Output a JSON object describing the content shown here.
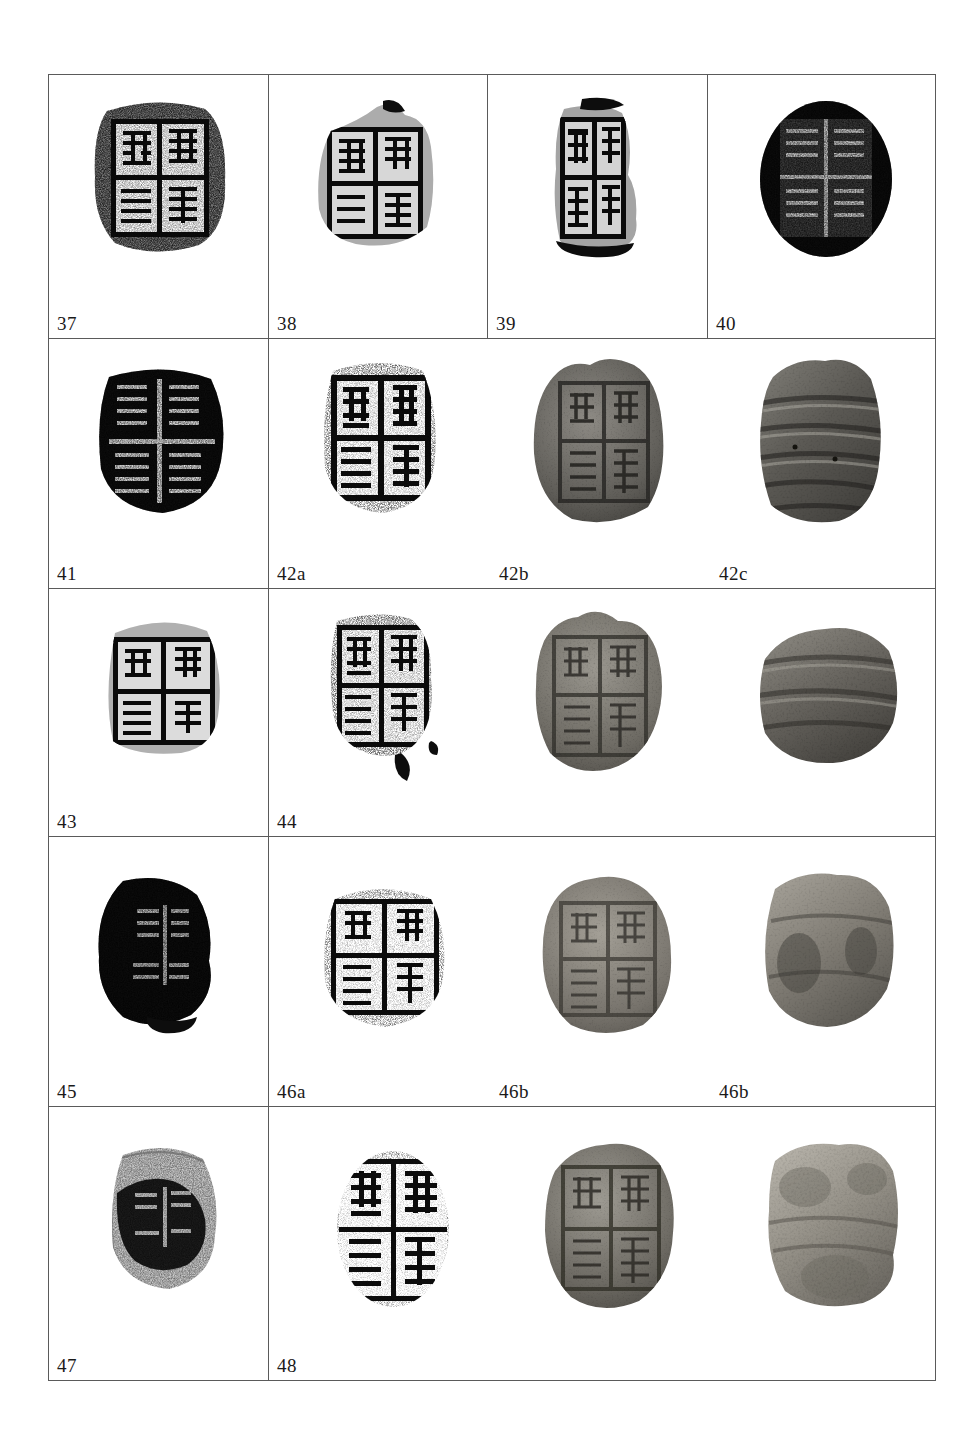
{
  "page": {
    "running_head": "",
    "plate_kind": "archaeological-plate",
    "figure_medium_legend": {
      "rubbing": "ink rubbing of seal impression",
      "photograph": "photograph of clay sealing"
    },
    "background_color": "#ffffff",
    "border_color": "#5a5a5a",
    "ink_color": "#0d0d0d"
  },
  "table": {
    "rows": [
      {
        "row_index": 1,
        "cells": [
          {
            "label": "37",
            "medium": "rubbing",
            "subject": "clay-sealing-impression",
            "colspan": 1,
            "figures": [
              {
                "name": "figure-37",
                "medium": "rubbing"
              }
            ]
          },
          {
            "label": "38",
            "medium": "rubbing",
            "subject": "clay-sealing-impression",
            "colspan": 1,
            "figures": [
              {
                "name": "figure-38",
                "medium": "rubbing"
              }
            ]
          },
          {
            "label": "39",
            "medium": "rubbing",
            "subject": "clay-sealing-impression",
            "colspan": 1,
            "figures": [
              {
                "name": "figure-39",
                "medium": "rubbing"
              }
            ]
          },
          {
            "label": "40",
            "medium": "rubbing",
            "subject": "clay-sealing-impression",
            "colspan": 1,
            "figures": [
              {
                "name": "figure-40",
                "medium": "rubbing"
              }
            ]
          }
        ]
      },
      {
        "row_index": 2,
        "cells": [
          {
            "label": "41",
            "medium": "rubbing",
            "subject": "clay-sealing-impression",
            "colspan": 1,
            "figures": [
              {
                "name": "figure-41",
                "medium": "rubbing"
              }
            ]
          },
          {
            "label": "42a",
            "label_b": "42b",
            "label_c": "42c",
            "medium": "mixed",
            "subject": "clay-sealing-set",
            "colspan": 3,
            "figures": [
              {
                "name": "figure-42a",
                "medium": "rubbing"
              },
              {
                "name": "figure-42b",
                "medium": "photograph"
              },
              {
                "name": "figure-42c",
                "medium": "photograph"
              }
            ]
          }
        ]
      },
      {
        "row_index": 3,
        "cells": [
          {
            "label": "43",
            "medium": "rubbing",
            "subject": "clay-sealing-impression",
            "colspan": 1,
            "figures": [
              {
                "name": "figure-43",
                "medium": "rubbing"
              }
            ]
          },
          {
            "label": "44",
            "label_b": "",
            "label_c": "",
            "medium": "mixed",
            "subject": "clay-sealing-set",
            "colspan": 3,
            "figures": [
              {
                "name": "figure-44-rubbing",
                "medium": "rubbing"
              },
              {
                "name": "figure-44-photo-front",
                "medium": "photograph"
              },
              {
                "name": "figure-44-photo-back",
                "medium": "photograph"
              }
            ]
          }
        ]
      },
      {
        "row_index": 4,
        "cells": [
          {
            "label": "45",
            "medium": "rubbing",
            "subject": "clay-sealing-impression",
            "colspan": 1,
            "figures": [
              {
                "name": "figure-45",
                "medium": "rubbing"
              }
            ]
          },
          {
            "label": "46a",
            "label_b": "46b",
            "label_c": "46b",
            "medium": "mixed",
            "subject": "clay-sealing-set",
            "colspan": 3,
            "figures": [
              {
                "name": "figure-46a",
                "medium": "rubbing"
              },
              {
                "name": "figure-46b-front",
                "medium": "photograph"
              },
              {
                "name": "figure-46b-back",
                "medium": "photograph"
              }
            ]
          }
        ]
      },
      {
        "row_index": 5,
        "cells": [
          {
            "label": "47",
            "medium": "rubbing",
            "subject": "clay-sealing-impression",
            "colspan": 1,
            "figures": [
              {
                "name": "figure-47",
                "medium": "rubbing"
              }
            ]
          },
          {
            "label": "48",
            "label_b": "",
            "label_c": "",
            "medium": "mixed",
            "subject": "clay-sealing-set",
            "colspan": 3,
            "figures": [
              {
                "name": "figure-48-rubbing",
                "medium": "rubbing"
              },
              {
                "name": "figure-48-photo-front",
                "medium": "photograph"
              },
              {
                "name": "figure-48-photo-back",
                "medium": "photograph"
              }
            ]
          }
        ]
      }
    ]
  }
}
